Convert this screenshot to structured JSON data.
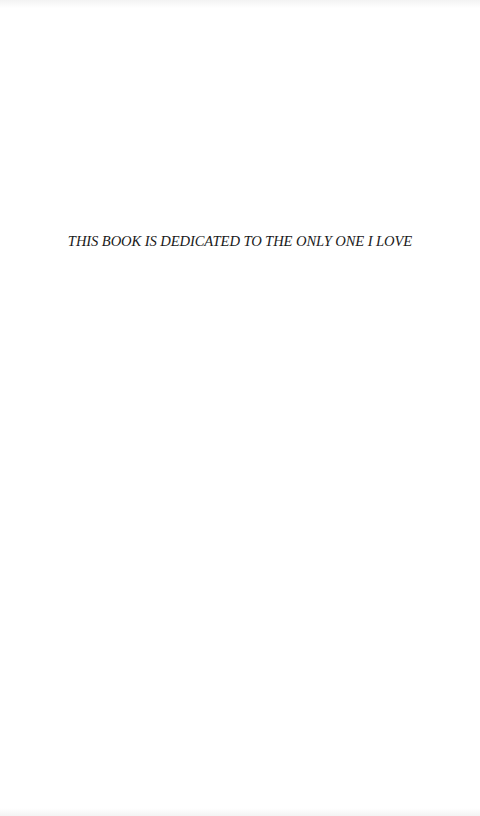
{
  "page": {
    "dedication": "THIS BOOK IS DEDICATED TO THE ONLY ONE I LOVE"
  },
  "colors": {
    "background": "#ffffff",
    "text": "#1a1a1a"
  }
}
